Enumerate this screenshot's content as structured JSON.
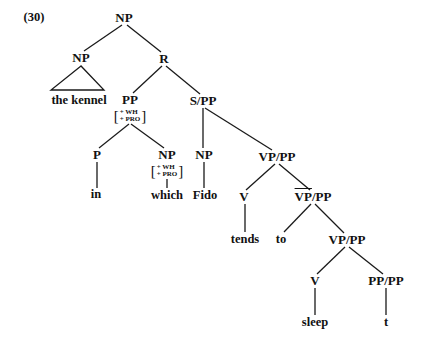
{
  "example_number": "(30)",
  "tree": {
    "root": {
      "label": "NP",
      "x": 124,
      "y": 18
    },
    "nodes": [
      {
        "id": "np_left",
        "label": "NP",
        "x": 81,
        "y": 58
      },
      {
        "id": "r",
        "label": "R",
        "x": 164,
        "y": 59
      },
      {
        "id": "pp",
        "label": "PP",
        "x": 130,
        "y": 100,
        "features": [
          "+ WH",
          "+ PRO"
        ]
      },
      {
        "id": "s_pp",
        "label": "S/PP",
        "x": 203,
        "y": 101
      },
      {
        "id": "p",
        "label": "P",
        "x": 97,
        "y": 155
      },
      {
        "id": "np_which",
        "label": "NP",
        "x": 167,
        "y": 155,
        "features": [
          "+ WH",
          "+ PRO"
        ]
      },
      {
        "id": "np_fido",
        "label": "NP",
        "x": 204,
        "y": 155
      },
      {
        "id": "vp_pp_1",
        "label": "VP/PP",
        "x": 277,
        "y": 157
      },
      {
        "id": "v_1",
        "label": "V",
        "x": 244,
        "y": 197
      },
      {
        "id": "vbar_pp",
        "label_bar": "VP",
        "label_rest": "/PP",
        "x": 313,
        "y": 197
      },
      {
        "id": "vp_pp_2",
        "label": "VP/PP",
        "x": 347,
        "y": 240
      },
      {
        "id": "v_2",
        "label": "V",
        "x": 315,
        "y": 281
      },
      {
        "id": "pp_pp",
        "label": "PP/PP",
        "x": 386,
        "y": 281
      }
    ],
    "leaves": [
      {
        "id": "the_kennel",
        "text": "the kennel",
        "x": 79,
        "y": 100
      },
      {
        "id": "in",
        "text": "in",
        "x": 96,
        "y": 194
      },
      {
        "id": "which",
        "text": "which",
        "x": 167,
        "y": 195
      },
      {
        "id": "fido",
        "text": "Fido",
        "x": 205,
        "y": 195
      },
      {
        "id": "tends",
        "text": "tends",
        "x": 245,
        "y": 239
      },
      {
        "id": "to",
        "text": "to",
        "x": 281,
        "y": 239
      },
      {
        "id": "sleep",
        "text": "sleep",
        "x": 315,
        "y": 322
      },
      {
        "id": "t",
        "text": "t",
        "x": 386,
        "y": 322
      }
    ]
  }
}
